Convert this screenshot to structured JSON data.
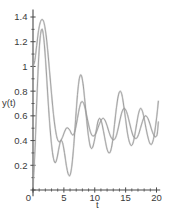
{
  "chart_data": {
    "type": "line",
    "title": "",
    "xlabel": "t",
    "ylabel": "y(t)",
    "xlim": [
      0,
      20.6
    ],
    "ylim": [
      0,
      1.45
    ],
    "xticks": [
      0,
      5,
      10,
      15,
      20
    ],
    "xticklabels": [
      "0",
      "5",
      "10",
      "15",
      "20"
    ],
    "yticks": [
      0,
      0.2,
      0.4,
      0.6,
      0.8,
      1,
      1.2,
      1.4
    ],
    "yticklabels": [
      "0",
      "0.2",
      "0.4",
      "0.6",
      "0.8",
      "1",
      "1.2",
      "1.4"
    ],
    "grid": false,
    "legend": false,
    "line_color": "#9a9a9a",
    "axis_color": "#4a4a4a",
    "background": "#ffffff",
    "series": [
      {
        "name": "y1",
        "x": [
          0,
          0.3,
          0.6,
          0.9,
          1.2,
          1.5,
          1.8,
          2.1,
          2.4,
          2.7,
          3.0,
          3.3,
          3.6,
          3.9,
          4.2,
          4.5,
          4.8,
          5.1,
          5.4,
          5.7,
          6.0,
          6.3,
          6.6,
          6.9,
          7.2,
          7.5,
          7.8,
          8.1,
          8.4,
          8.7,
          9.0,
          9.3,
          9.6,
          9.9,
          10.2,
          10.5,
          10.8,
          11.1,
          11.4,
          11.7,
          12.0,
          12.3,
          12.6,
          12.9,
          13.2,
          13.5,
          13.8,
          14.1,
          14.4,
          14.7,
          15.0,
          15.3,
          15.6,
          15.9,
          16.2,
          16.5,
          16.8,
          17.1,
          17.4,
          17.7,
          18.0,
          18.3,
          18.6,
          18.9,
          19.2,
          19.5,
          19.8,
          20.1,
          20.3
        ],
        "y": [
          1.0,
          1.05,
          1.17,
          1.29,
          1.36,
          1.38,
          1.35,
          1.26,
          1.12,
          0.95,
          0.78,
          0.62,
          0.5,
          0.42,
          0.39,
          0.4,
          0.43,
          0.47,
          0.5,
          0.5,
          0.48,
          0.45,
          0.45,
          0.5,
          0.58,
          0.66,
          0.71,
          0.71,
          0.67,
          0.6,
          0.53,
          0.47,
          0.44,
          0.44,
          0.46,
          0.5,
          0.54,
          0.57,
          0.58,
          0.56,
          0.52,
          0.47,
          0.43,
          0.41,
          0.41,
          0.44,
          0.5,
          0.57,
          0.63,
          0.66,
          0.65,
          0.61,
          0.55,
          0.49,
          0.44,
          0.42,
          0.42,
          0.45,
          0.5,
          0.55,
          0.59,
          0.6,
          0.58,
          0.54,
          0.49,
          0.45,
          0.43,
          0.45,
          0.55
        ]
      },
      {
        "name": "y2",
        "x": [
          0,
          0.3,
          0.6,
          0.9,
          1.2,
          1.5,
          1.8,
          2.1,
          2.4,
          2.7,
          3.0,
          3.3,
          3.6,
          3.9,
          4.2,
          4.5,
          4.8,
          5.1,
          5.4,
          5.7,
          6.0,
          6.3,
          6.6,
          6.9,
          7.2,
          7.5,
          7.8,
          8.1,
          8.4,
          8.7,
          9.0,
          9.3,
          9.6,
          9.9,
          10.2,
          10.5,
          10.8,
          11.1,
          11.4,
          11.7,
          12.0,
          12.3,
          12.6,
          12.9,
          13.2,
          13.5,
          13.8,
          14.1,
          14.4,
          14.7,
          15.0,
          15.3,
          15.6,
          15.9,
          16.2,
          16.5,
          16.8,
          17.1,
          17.4,
          17.7,
          18.0,
          18.3,
          18.6,
          18.9,
          19.2,
          19.5,
          19.8,
          20.1,
          20.3
        ],
        "y": [
          0.02,
          0.3,
          0.7,
          1.05,
          1.25,
          1.3,
          1.2,
          1.0,
          0.76,
          0.54,
          0.37,
          0.26,
          0.22,
          0.26,
          0.34,
          0.4,
          0.38,
          0.3,
          0.2,
          0.13,
          0.12,
          0.2,
          0.36,
          0.57,
          0.77,
          0.9,
          0.93,
          0.86,
          0.72,
          0.56,
          0.43,
          0.35,
          0.34,
          0.39,
          0.47,
          0.55,
          0.58,
          0.55,
          0.48,
          0.4,
          0.33,
          0.3,
          0.32,
          0.4,
          0.53,
          0.66,
          0.76,
          0.8,
          0.77,
          0.68,
          0.57,
          0.46,
          0.39,
          0.36,
          0.38,
          0.45,
          0.54,
          0.62,
          0.66,
          0.64,
          0.58,
          0.5,
          0.43,
          0.38,
          0.37,
          0.41,
          0.5,
          0.62,
          0.72
        ]
      }
    ]
  }
}
